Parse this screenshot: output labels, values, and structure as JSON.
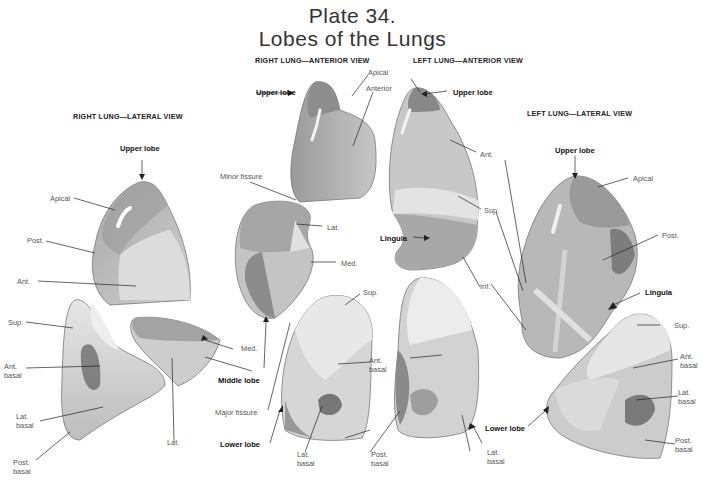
{
  "plate": {
    "number": "Plate 34.",
    "title": "Lobes of the Lungs"
  },
  "views": {
    "right_lateral": "RIGHT LUNG—LATERAL VIEW",
    "right_anterior": "RIGHT LUNG—ANTERIOR VIEW",
    "left_anterior": "LEFT LUNG—ANTERIOR VIEW",
    "left_lateral": "LEFT LUNG—LATERAL VIEW"
  },
  "labels": {
    "rl_upper_lobe": "Upper lobe",
    "rl_apical": "Apical",
    "rl_post": "Post.",
    "rl_ant": "Ant.",
    "rl_sup": "Sup.",
    "rl_ant_basal": "Ant.\nbasal",
    "rl_lat_basal": "Lat.\nbasal",
    "rl_post_basal": "Post.\nbasal",
    "rl_lat": "Lat.",
    "rl_med": "Med.",
    "ra_upper_lobe": "Upper lobe",
    "ra_apical": "Apical",
    "ra_anterior": "Anterior",
    "ra_minor_fissure": "Minor fissure",
    "ra_lat": "Lat.",
    "ra_med": "Med.",
    "ra_middle_lobe": "Middle lobe",
    "ra_major_fissure": "Major fissure",
    "ra_lower_lobe": "Lower lobe",
    "ra_sup": "Sup.",
    "ra_ant_basal": "Ant.\nbasal",
    "ra_lat_basal": "Lat.\nbasal",
    "ra_post_basal": "Post.\nbasal",
    "la_upper_lobe": "Upper lobe",
    "la_ant": "Ant.",
    "la_sup": "Sup.",
    "la_inf": "Inf.",
    "la_lingula": "Lingula",
    "la_lower_lobe": "Lower lobe",
    "la_lat_basal": "Lat.\nbasal",
    "ll_upper_lobe": "Upper lobe",
    "ll_apical": "Apical",
    "ll_post": "Post.",
    "ll_lingula": "Lingula",
    "ll_sup": "Sup.",
    "ll_ant_basal": "Ant.\nbasal",
    "ll_lat_basal": "Lat.\nbasal",
    "ll_post_basal": "Post.\nbasal"
  },
  "colors": {
    "background": "#ffffff",
    "lobe_light": "#d9d9d9",
    "lobe_mid": "#b5b5b5",
    "lobe_dark": "#8a8a8a",
    "leader_line": "#222222"
  }
}
